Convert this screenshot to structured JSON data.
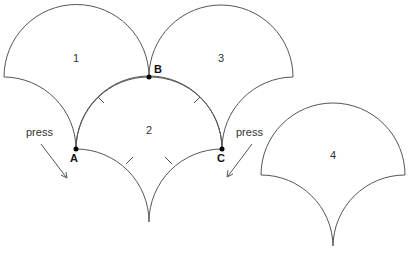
{
  "diagram": {
    "shapes": [
      {
        "id": "1",
        "label": "1"
      },
      {
        "id": "2",
        "label": "2"
      },
      {
        "id": "3",
        "label": "3"
      },
      {
        "id": "4",
        "label": "4"
      }
    ],
    "points": {
      "A": "A",
      "B": "B",
      "C": "C"
    },
    "annotations": {
      "press_left": "press",
      "press_right": "press"
    },
    "colors": {
      "stroke": "#555555",
      "point": "#000000",
      "background": "#ffffff"
    }
  }
}
